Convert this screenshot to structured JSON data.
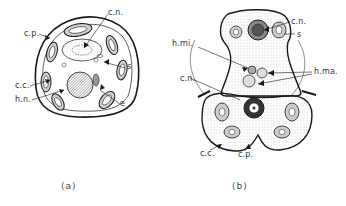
{
  "figure": {
    "panels": [
      {
        "id": "a",
        "caption": "(a)",
        "labels": {
          "cp": "c.p.",
          "cn": "c.n.",
          "s": "s",
          "cc": "c.c.",
          "hn": "h.n.",
          "e": "e"
        }
      },
      {
        "id": "b",
        "caption": "(b)",
        "labels": {
          "cn_top": "c.n.",
          "s": "s",
          "hmi": "h.mi.",
          "hma": "h.ma.",
          "cn_left": "c.n.",
          "cc": "c.c.",
          "cp": "c.p."
        }
      }
    ],
    "colors": {
      "ink": "#1a1a1a",
      "stipple": "#888888",
      "background": "#ffffff"
    }
  }
}
